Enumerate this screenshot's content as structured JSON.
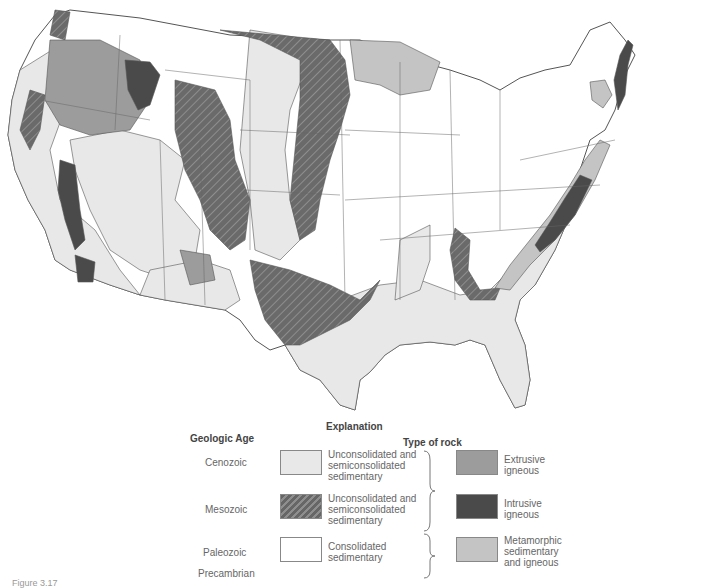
{
  "map": {
    "title": "Geologic map of the conterminous United States",
    "colors": {
      "cenozoic_sedimentary": "#e8e8e8",
      "mesozoic_sedimentary": "#6a6a6a",
      "hatch_line": "#8a8a8a",
      "paleozoic_sedimentary": "#ffffff",
      "extrusive_igneous": "#9c9c9c",
      "intrusive_igneous": "#4a4a4a",
      "metamorphic": "#c4c4c4",
      "border": "#555555"
    }
  },
  "legend": {
    "title": "Explanation",
    "geologic_age_header": "Geologic Age",
    "type_of_rock_header": "Type of rock",
    "ages": [
      "Cenozoic",
      "Mesozoic",
      "Paleozoic",
      "Precambrian"
    ],
    "sedimentary_units": [
      {
        "age": "Cenozoic",
        "label_lines": [
          "Unconsolidated and",
          "semiconsolidated",
          "sedimentary"
        ],
        "pattern": "light-gray"
      },
      {
        "age": "Mesozoic",
        "label_lines": [
          "Unconsolidated and",
          "semiconsolidated",
          "sedimentary"
        ],
        "pattern": "dark-hatched"
      },
      {
        "age": "Paleozoic / Precambrian",
        "label_lines": [
          "Consolidated",
          "sedimentary"
        ],
        "pattern": "white"
      }
    ],
    "rock_types": [
      {
        "label_lines": [
          "Extrusive",
          "igneous"
        ],
        "pattern": "medium-gray"
      },
      {
        "label_lines": [
          "Intrusive",
          "igneous"
        ],
        "pattern": "dark-gray"
      },
      {
        "label_lines": [
          "Metamorphic",
          "sedimentary",
          "and igneous"
        ],
        "pattern": "light-medium-gray"
      }
    ]
  },
  "caption": "Figure 3.17"
}
